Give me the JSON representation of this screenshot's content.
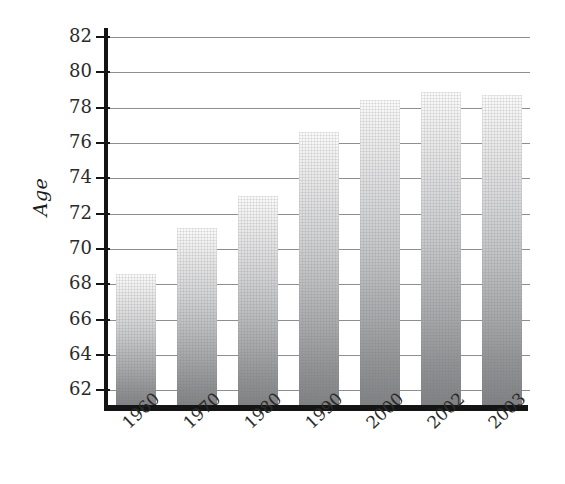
{
  "chart_data": {
    "type": "bar",
    "title": "",
    "subtitle": "",
    "xlabel": "",
    "ylabel": "Age",
    "categories": [
      "1960",
      "1970",
      "1980",
      "1990",
      "2000",
      "2002",
      "2003"
    ],
    "values": [
      68.6,
      71.2,
      73.0,
      76.6,
      78.4,
      78.9,
      78.7
    ],
    "series": [
      {
        "name": "Life expectancy",
        "values": [
          68.6,
          71.2,
          73.0,
          76.6,
          78.4,
          78.9,
          78.7
        ]
      }
    ],
    "ylim": [
      61.0,
      82.5
    ],
    "ytick_values": [
      62,
      64,
      66,
      68,
      70,
      72,
      74,
      76,
      78,
      80,
      82
    ],
    "ytick_labels": [
      "62",
      "64",
      "66",
      "68",
      "70",
      "72",
      "74",
      "76",
      "78",
      "80",
      "82"
    ],
    "ytick_step": 2,
    "xtick_labels": [
      "1960",
      "1970",
      "1980",
      "1990",
      "2000",
      "2002",
      "2003"
    ],
    "xtick_rotation_degrees": -43,
    "grid": true,
    "grid_axis": "y",
    "legend": false,
    "legend_position": "none",
    "annotations": [],
    "bar_fill": "vertical gradient light-gray to mid-gray with crosshatch texture",
    "colors": {
      "bar_gradient_top": "#fbfbfb",
      "bar_gradient_bottom": "#7e8082",
      "gridline": "#8e8e8e",
      "axis": "#141414",
      "tick_label": "#2a2a2a",
      "axis_title": "#1c1c1c",
      "background": "#ffffff"
    }
  },
  "axis": {
    "y_title": "Age"
  }
}
